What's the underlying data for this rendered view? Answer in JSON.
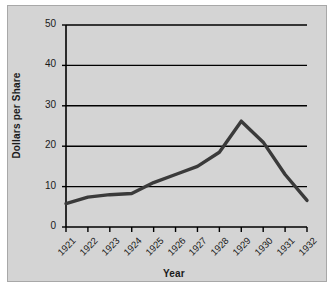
{
  "chart_data": {
    "type": "line",
    "title": "",
    "xlabel": "Year",
    "ylabel": "Dollars per Share",
    "categories": [
      "1921",
      "1922",
      "1923",
      "1924",
      "1925",
      "1926",
      "1927",
      "1928",
      "1929",
      "1930",
      "1931",
      "1932"
    ],
    "x": [
      1921,
      1922,
      1923,
      1924,
      1925,
      1926,
      1927,
      1928,
      1929,
      1930,
      1931,
      1932
    ],
    "values": [
      5.8,
      7.4,
      8.0,
      8.3,
      11.0,
      13.0,
      15.0,
      18.5,
      26.2,
      21.0,
      13.0,
      6.6
    ],
    "series": [
      {
        "name": "Dollars per Share",
        "values": [
          5.8,
          7.4,
          8.0,
          8.3,
          11.0,
          13.0,
          15.0,
          18.5,
          26.2,
          21.0,
          13.0,
          6.6
        ]
      }
    ],
    "yticks": [
      0,
      10,
      20,
      30,
      40,
      50
    ],
    "ytick_labels": [
      "0",
      "10",
      "20",
      "30",
      "40",
      "50"
    ],
    "ylim": [
      0,
      50
    ],
    "xlim": [
      1921,
      1932
    ],
    "grid": "horizontal",
    "legend": "none",
    "line_color": "#3a3a3a",
    "grid_color": "#000000",
    "axis_color": "#000000",
    "background_color": "#d4d4d4"
  },
  "figure": {
    "frame_label": "chart-frame"
  }
}
